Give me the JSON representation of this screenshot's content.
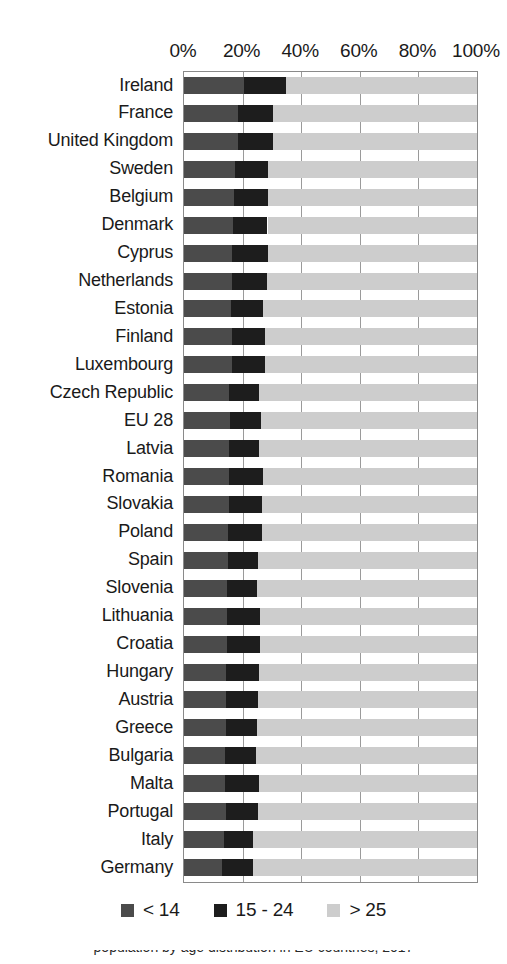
{
  "chart_data": {
    "type": "bar",
    "orientation": "horizontal",
    "stacked": true,
    "stack_mode": "percent",
    "title": "",
    "subtitle": "",
    "xlabel": "",
    "ylabel": "",
    "xlim": [
      0,
      100
    ],
    "grid": true,
    "grid_axis": "x",
    "legend_position": "bottom",
    "x_tick_labels": [
      "0%",
      "20%",
      "40%",
      "60%",
      "80%",
      "100%"
    ],
    "x_ticks": [
      0,
      20,
      40,
      60,
      80,
      100
    ],
    "categories": [
      "Ireland",
      "France",
      "United Kingdom",
      "Sweden",
      "Belgium",
      "Denmark",
      "Cyprus",
      "Netherlands",
      "Estonia",
      "Finland",
      "Luxembourg",
      "Czech Republic",
      "EU 28",
      "Latvia",
      "Romania",
      "Slovakia",
      "Poland",
      "Spain",
      "Slovenia",
      "Lithuania",
      "Croatia",
      "Hungary",
      "Austria",
      "Greece",
      "Bulgaria",
      "Malta",
      "Portugal",
      "Italy",
      "Germany"
    ],
    "series": [
      {
        "name": "< 14",
        "color": "#4b4b4b",
        "values": [
          20.5,
          18.5,
          18.5,
          17.5,
          17.0,
          16.8,
          16.5,
          16.5,
          16.0,
          16.3,
          16.5,
          15.2,
          15.6,
          15.4,
          15.5,
          15.2,
          15.0,
          15.0,
          14.8,
          14.6,
          14.6,
          14.5,
          14.4,
          14.4,
          14.0,
          14.0,
          14.2,
          13.7,
          13.0
        ]
      },
      {
        "name": "15 - 24",
        "color": "#1d1d1d",
        "values": [
          14.3,
          12.0,
          11.8,
          11.2,
          11.7,
          11.7,
          12.0,
          11.8,
          11.0,
          11.3,
          11.3,
          10.4,
          10.7,
          10.2,
          11.5,
          11.5,
          11.5,
          10.2,
          10.0,
          11.2,
          11.2,
          11.0,
          11.0,
          10.5,
          10.6,
          11.5,
          11.0,
          10.0,
          10.6
        ]
      },
      {
        "name": "> 25",
        "color": "#cdcdcd",
        "values": [
          65.2,
          69.5,
          69.7,
          71.3,
          71.3,
          71.5,
          71.5,
          71.7,
          73.0,
          72.4,
          72.2,
          74.4,
          73.7,
          74.4,
          73.0,
          73.3,
          73.5,
          74.8,
          75.2,
          74.2,
          74.2,
          74.5,
          74.6,
          75.1,
          75.4,
          74.5,
          74.8,
          76.3,
          76.4
        ]
      }
    ]
  },
  "legend": {
    "items": [
      {
        "label": "< 14",
        "color": "#4b4b4b"
      },
      {
        "label": "15 - 24",
        "color": "#1d1d1d"
      },
      {
        "label": "> 25",
        "color": "#cdcdcd"
      }
    ]
  },
  "caption": {
    "text": "population by age distribution in EU countries, 2017"
  }
}
